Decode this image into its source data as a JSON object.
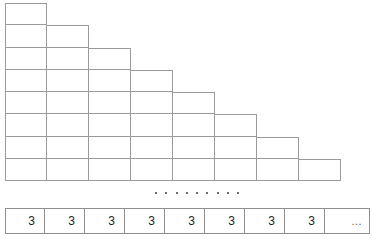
{
  "figure": {
    "type": "staircase-grid-with-value-row",
    "staircase": {
      "rows": 8,
      "max_columns": 8,
      "cell_width_px": 42,
      "cell_height_px": 22,
      "row_cell_counts": [
        1,
        2,
        3,
        4,
        5,
        6,
        7,
        8
      ],
      "border_color": "#9b9b9b",
      "fill_color": "#ffffff"
    },
    "dots_row": {
      "count": 9,
      "color": "#3a3a4a",
      "meaning": "continuation-ellipsis"
    },
    "value_row": {
      "border_color": "#8e8e8e",
      "text_color": "#1d1d1d",
      "cells": [
        {
          "label": "3"
        },
        {
          "label": "3"
        },
        {
          "label": "3"
        },
        {
          "label": "3"
        },
        {
          "label": "3"
        },
        {
          "label": "3"
        },
        {
          "label": "3"
        },
        {
          "label": "3"
        },
        {
          "label": "…"
        }
      ]
    }
  }
}
